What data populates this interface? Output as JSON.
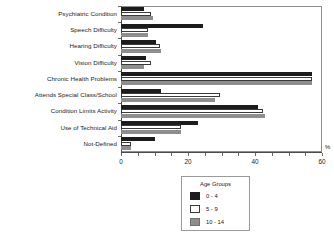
{
  "chart_data": {
    "type": "bar",
    "orientation": "horizontal",
    "title": "",
    "xlabel": "%",
    "ylabel": "",
    "xlim": [
      0,
      60
    ],
    "xticks": [
      0,
      20,
      40,
      60
    ],
    "xtick_labels": [
      "0",
      "20",
      "40",
      "60"
    ],
    "minor_tick_step": 5,
    "grid": false,
    "legend_position": "below-right",
    "legend_title": "Age Groups",
    "categories": [
      "Psychiatric Condition",
      "Speech Difficulty",
      "Hearing Difficulty",
      "Vision Difficulty",
      "Chronic Health Problems",
      "Attends Special Class/School",
      "Condition Limits Activity",
      "Use of Technical Aid",
      "Not-Defined"
    ],
    "series": [
      {
        "name": "0 - 4",
        "color": "#1c1c1c",
        "values": [
          7.0,
          24.5,
          10.5,
          7.5,
          57.0,
          12.0,
          41.0,
          23.0,
          10.0
        ]
      },
      {
        "name": "5 - 9",
        "color": "#ffffff",
        "values": [
          9.0,
          8.0,
          11.5,
          9.0,
          57.0,
          29.5,
          42.5,
          18.0,
          3.0
        ]
      },
      {
        "name": "10 - 14",
        "color": "#8e8e8e",
        "values": [
          9.5,
          8.0,
          12.0,
          7.0,
          57.0,
          28.0,
          43.0,
          18.0,
          3.0
        ]
      }
    ]
  },
  "axis": {
    "unit_label": "%"
  },
  "legend": {
    "title": "Age Groups",
    "items": [
      {
        "label": "0 - 4"
      },
      {
        "label": "5 - 9"
      },
      {
        "label": "10 - 14"
      }
    ]
  }
}
